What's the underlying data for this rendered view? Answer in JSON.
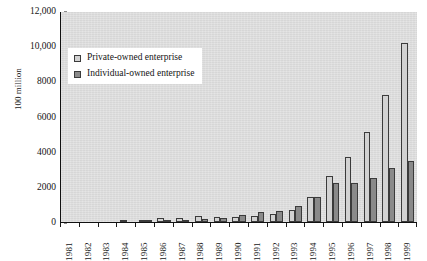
{
  "chart_data": {
    "type": "bar",
    "title": "",
    "xlabel": "",
    "ylabel": "100 million",
    "ylim": [
      0,
      12000
    ],
    "yticks": [
      0,
      2000,
      4000,
      6000,
      8000,
      10000,
      12000
    ],
    "ytick_labels": [
      "0",
      "2000",
      "4000",
      "6000",
      "8000",
      "10,000",
      "12,000"
    ],
    "grid": false,
    "legend_position": "upper-left-inside",
    "categories": [
      "1981",
      "1982",
      "1983",
      "1984",
      "1985",
      "1986",
      "1987",
      "1988",
      "1989",
      "1990",
      "1991",
      "1992",
      "1993",
      "1994",
      "1995",
      "1996",
      "1997",
      "1998",
      "1999"
    ],
    "series": [
      {
        "name": "Private-owned enterprise",
        "color": "#d2d2d2",
        "values": [
          0,
          0,
          0,
          90,
          140,
          230,
          250,
          320,
          300,
          280,
          320,
          450,
          680,
          1400,
          2600,
          3700,
          5100,
          7200,
          10200
        ]
      },
      {
        "name": "Individual-owned enterprise",
        "color": "#8a8a8a",
        "values": [
          0,
          0,
          0,
          0,
          60,
          80,
          120,
          180,
          200,
          420,
          560,
          620,
          900,
          1450,
          2200,
          2200,
          2500,
          3100,
          3450
        ]
      }
    ]
  },
  "legend": {
    "items": [
      {
        "label": "Private-owned enterprise"
      },
      {
        "label": "Individual-owned enterprise"
      }
    ]
  }
}
